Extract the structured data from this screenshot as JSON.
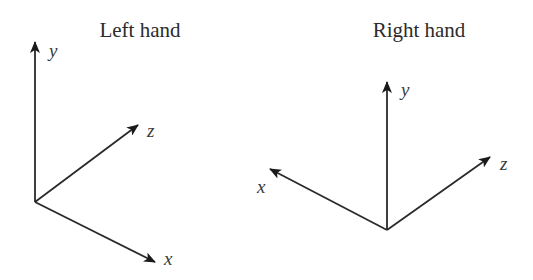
{
  "diagram": {
    "panels": [
      {
        "title": "Left hand",
        "axes": [
          {
            "name": "y",
            "label": "y"
          },
          {
            "name": "z",
            "label": "z"
          },
          {
            "name": "x",
            "label": "x"
          }
        ]
      },
      {
        "title": "Right hand",
        "axes": [
          {
            "name": "y",
            "label": "y"
          },
          {
            "name": "x",
            "label": "x"
          },
          {
            "name": "z",
            "label": "z"
          }
        ]
      }
    ],
    "colors": {
      "line": "#2a2a2a",
      "text": "#2b2b2b",
      "background": "#ffffff"
    }
  }
}
